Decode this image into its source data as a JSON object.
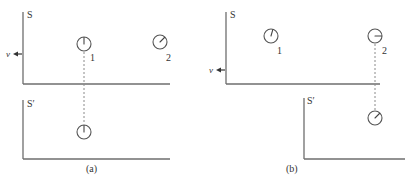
{
  "figure": {
    "panel_a": {
      "caption": "(a)",
      "frame_S": {
        "label": "S"
      },
      "frame_S_prime": {
        "label": "S′"
      },
      "velocity_label": "v",
      "velocity_direction": "left",
      "clocks_S": [
        {
          "id": "1",
          "label": "1",
          "hand": "12 o'clock"
        },
        {
          "id": "2",
          "label": "2",
          "hand": "about 1:30"
        }
      ],
      "clocks_S_prime": [
        {
          "aligned_with": "1",
          "hand": "12 o'clock"
        }
      ]
    },
    "panel_b": {
      "caption": "(b)",
      "frame_S": {
        "label": "S"
      },
      "frame_S_prime": {
        "label": "S′"
      },
      "velocity_label": "v",
      "velocity_direction": "left",
      "clocks_S": [
        {
          "id": "1",
          "label": "1",
          "hand": "about 12:30"
        },
        {
          "id": "2",
          "label": "2",
          "hand": "3 o'clock"
        }
      ],
      "clocks_S_prime": [
        {
          "aligned_with": "2",
          "hand": "about 1:30"
        }
      ]
    }
  }
}
